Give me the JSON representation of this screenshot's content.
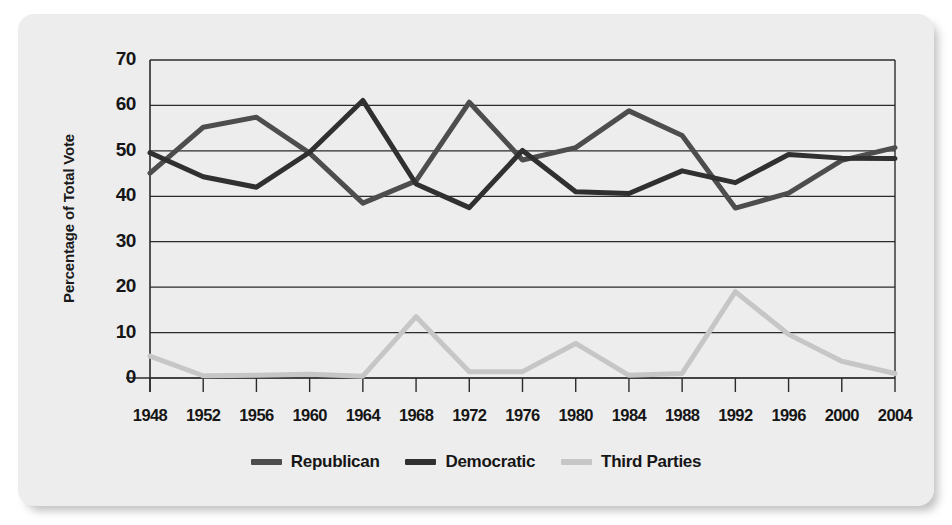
{
  "figure": {
    "background_color": "#ededed",
    "page_background": "#ffffff"
  },
  "chart_data": {
    "type": "line",
    "title": "",
    "xlabel": "",
    "ylabel": "Percentage of Total Vote",
    "ylim": [
      0,
      70
    ],
    "yticks": [
      0,
      10,
      20,
      30,
      40,
      50,
      60,
      70
    ],
    "grid": true,
    "legend_position": "bottom",
    "categories": [
      "1948",
      "1952",
      "1956",
      "1960",
      "1964",
      "1968",
      "1972",
      "1976",
      "1980",
      "1984",
      "1988",
      "1992",
      "1996",
      "2000",
      "2004"
    ],
    "series": [
      {
        "name": "Republican",
        "color": "#4d4d4d",
        "values": [
          45.1,
          55.2,
          57.4,
          49.5,
          38.5,
          43.4,
          60.7,
          48.0,
          50.7,
          58.8,
          53.4,
          37.4,
          40.7,
          47.9,
          50.7
        ]
      },
      {
        "name": "Democratic",
        "color": "#303030",
        "values": [
          49.6,
          44.3,
          42.0,
          49.7,
          61.1,
          42.7,
          37.5,
          50.1,
          41.0,
          40.6,
          45.6,
          43.0,
          49.2,
          48.4,
          48.3
        ]
      },
      {
        "name": "Third Parties",
        "color": "#c6c6c6",
        "values": [
          4.8,
          0.5,
          0.6,
          0.8,
          0.4,
          13.5,
          1.4,
          1.4,
          7.6,
          0.6,
          1.0,
          19.0,
          9.6,
          3.7,
          1.0
        ]
      }
    ]
  },
  "legend": {
    "items": [
      {
        "label": "Republican",
        "color": "#4d4d4d"
      },
      {
        "label": "Democratic",
        "color": "#303030"
      },
      {
        "label": "Third Parties",
        "color": "#c6c6c6"
      }
    ]
  }
}
